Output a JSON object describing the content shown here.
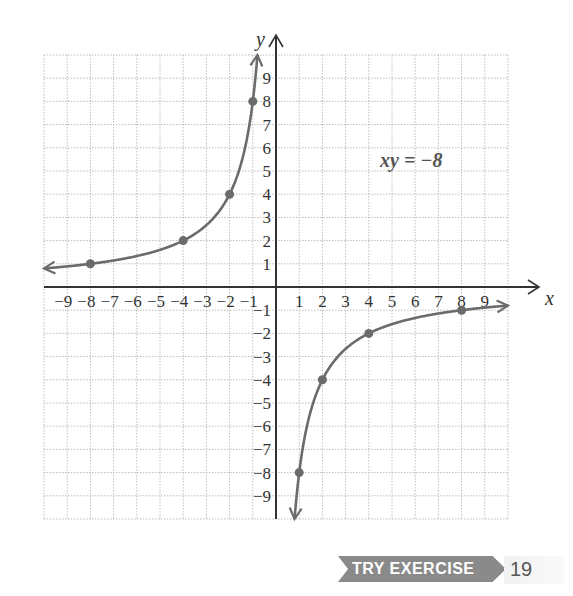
{
  "chart_data": {
    "type": "line",
    "title": "",
    "equation_label": "xy = −8",
    "xlabel": "x",
    "ylabel": "y",
    "xlim": [
      -10,
      10
    ],
    "ylim": [
      -10,
      10
    ],
    "grid": true,
    "x_tick_labels": [
      "−9",
      "−8",
      "−7",
      "−6",
      "−5",
      "−4",
      "−3",
      "−2",
      "−1",
      "1",
      "2",
      "3",
      "4",
      "5",
      "6",
      "7",
      "8",
      "9"
    ],
    "y_tick_labels": [
      "9",
      "8",
      "7",
      "6",
      "5",
      "4",
      "3",
      "2",
      "1",
      "−1",
      "−2",
      "−3",
      "−4",
      "−5",
      "−6",
      "−7",
      "−8",
      "−9"
    ],
    "series": [
      {
        "name": "branch-left (x<0)",
        "function": "y = -8/x",
        "x_range": [
          -10,
          -0.8
        ],
        "points": [
          {
            "x": -8,
            "y": 1
          },
          {
            "x": -4,
            "y": 2
          },
          {
            "x": -2,
            "y": 4
          },
          {
            "x": -1,
            "y": 8
          }
        ]
      },
      {
        "name": "branch-right (x>0)",
        "function": "y = -8/x",
        "x_range": [
          0.8,
          10
        ],
        "points": [
          {
            "x": 1,
            "y": -8
          },
          {
            "x": 2,
            "y": -4
          },
          {
            "x": 4,
            "y": -2
          },
          {
            "x": 8,
            "y": -1
          }
        ]
      }
    ],
    "colors": {
      "curve": "#6b6b6b",
      "axis": "#333333",
      "grid": "#bdbdbd"
    }
  },
  "banner": {
    "label": "TRY EXERCISE",
    "number": "19"
  }
}
